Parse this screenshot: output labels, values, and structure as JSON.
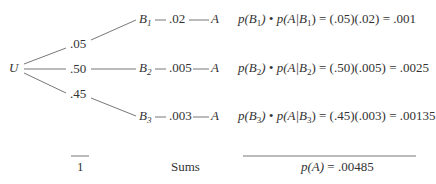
{
  "tree": {
    "root": "U",
    "branches": [
      {
        "prob": ".05",
        "node": "B",
        "node_sub": "1",
        "cond_prob": ".02",
        "leaf": "A"
      },
      {
        "prob": ".50",
        "node": "B",
        "node_sub": "2",
        "cond_prob": ".005",
        "leaf": "A"
      },
      {
        "prob": ".45",
        "node": "B",
        "node_sub": "3",
        "cond_prob": ".003",
        "leaf": "A"
      }
    ]
  },
  "products": [
    {
      "p": "p(B",
      "sub": "1",
      "mid": ") • p(A|B",
      "sub2": "1",
      "rest": ") = (.05)(.02) = .001"
    },
    {
      "p": "p(B",
      "sub": "2",
      "mid": ") • p(A|B",
      "sub2": "2",
      "rest": ") = (.50)(.005) = .0025"
    },
    {
      "p": "p(B",
      "sub": "3",
      "mid": ") • p(A|B",
      "sub2": "3",
      "rest": ") = (.45)(.003) = .00135"
    }
  ],
  "sums": {
    "label": "Sums",
    "prob_total": "1",
    "result_lhs": "p(A)",
    "result_rhs": " = .00485"
  }
}
